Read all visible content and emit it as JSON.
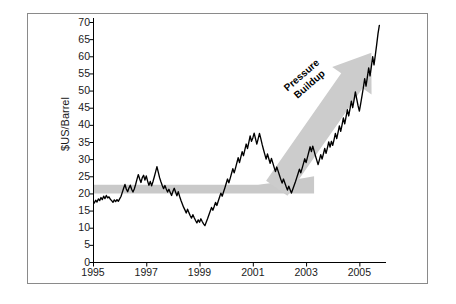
{
  "chart_data": {
    "type": "line",
    "title": "",
    "xlabel": "",
    "ylabel": "$US/Barrel",
    "xlim": [
      1995,
      2006
    ],
    "ylim": [
      0,
      70
    ],
    "grid": false,
    "legend": null,
    "x_ticks": [
      "1995",
      "1997",
      "1999",
      "2001",
      "2003",
      "2005"
    ],
    "x_tick_values": [
      1995,
      1997,
      1999,
      2001,
      2003,
      2005
    ],
    "y_ticks": [
      "0",
      "5",
      "10",
      "15",
      "20",
      "25",
      "30",
      "35",
      "40",
      "45",
      "50",
      "55",
      "60",
      "65",
      "70"
    ],
    "y_tick_values": [
      0,
      5,
      10,
      15,
      20,
      25,
      30,
      35,
      40,
      45,
      50,
      55,
      60,
      65,
      70
    ],
    "series": [
      {
        "name": "Crude oil price",
        "color": "#000000",
        "x": [
          1995.0,
          1995.05,
          1995.1,
          1995.15,
          1995.2,
          1995.25,
          1995.3,
          1995.35,
          1995.4,
          1995.45,
          1995.5,
          1995.55,
          1995.6,
          1995.65,
          1995.7,
          1995.75,
          1995.8,
          1995.85,
          1995.9,
          1995.95,
          1996.0,
          1996.05,
          1996.1,
          1996.15,
          1996.2,
          1996.25,
          1996.3,
          1996.35,
          1996.4,
          1996.45,
          1996.5,
          1996.55,
          1996.6,
          1996.65,
          1996.7,
          1996.75,
          1996.8,
          1996.85,
          1996.9,
          1996.95,
          1997.0,
          1997.05,
          1997.1,
          1997.15,
          1997.2,
          1997.25,
          1997.3,
          1997.35,
          1997.4,
          1997.45,
          1997.5,
          1997.55,
          1997.6,
          1997.65,
          1997.7,
          1997.75,
          1997.8,
          1997.85,
          1997.9,
          1997.95,
          1998.0,
          1998.05,
          1998.1,
          1998.15,
          1998.2,
          1998.25,
          1998.3,
          1998.35,
          1998.4,
          1998.45,
          1998.5,
          1998.55,
          1998.6,
          1998.65,
          1998.7,
          1998.75,
          1998.8,
          1998.85,
          1998.9,
          1998.95,
          1999.0,
          1999.05,
          1999.1,
          1999.15,
          1999.2,
          1999.25,
          1999.3,
          1999.35,
          1999.4,
          1999.45,
          1999.5,
          1999.55,
          1999.6,
          1999.65,
          1999.7,
          1999.75,
          1999.8,
          1999.85,
          1999.9,
          1999.95,
          2000.0,
          2000.05,
          2000.1,
          2000.15,
          2000.2,
          2000.25,
          2000.3,
          2000.35,
          2000.4,
          2000.45,
          2000.5,
          2000.55,
          2000.6,
          2000.65,
          2000.7,
          2000.75,
          2000.8,
          2000.85,
          2000.9,
          2000.95,
          2001.0,
          2001.05,
          2001.1,
          2001.15,
          2001.2,
          2001.25,
          2001.3,
          2001.35,
          2001.4,
          2001.45,
          2001.5,
          2001.55,
          2001.6,
          2001.65,
          2001.7,
          2001.75,
          2001.8,
          2001.85,
          2001.9,
          2001.95,
          2002.0,
          2002.05,
          2002.1,
          2002.15,
          2002.2,
          2002.25,
          2002.3,
          2002.35,
          2002.4,
          2002.45,
          2002.5,
          2002.55,
          2002.6,
          2002.65,
          2002.7,
          2002.75,
          2002.8,
          2002.85,
          2002.9,
          2002.95,
          2003.0,
          2003.05,
          2003.1,
          2003.15,
          2003.2,
          2003.25,
          2003.3,
          2003.35,
          2003.4,
          2003.45,
          2003.5,
          2003.55,
          2003.6,
          2003.65,
          2003.7,
          2003.75,
          2003.8,
          2003.85,
          2003.9,
          2003.95,
          2004.0,
          2004.05,
          2004.1,
          2004.15,
          2004.2,
          2004.25,
          2004.3,
          2004.35,
          2004.4,
          2004.45,
          2004.5,
          2004.55,
          2004.6,
          2004.65,
          2004.7,
          2004.75,
          2004.8,
          2004.85,
          2004.9,
          2004.95,
          2005.0,
          2005.05,
          2005.1,
          2005.15,
          2005.2,
          2005.25,
          2005.3,
          2005.35,
          2005.4,
          2005.45,
          2005.5,
          2005.55,
          2005.6,
          2005.65,
          2005.7,
          2005.75
        ],
        "y": [
          17.8,
          17.2,
          18.0,
          17.5,
          18.4,
          17.9,
          18.8,
          18.2,
          19.2,
          18.5,
          19.4,
          18.7,
          19.0,
          18.3,
          17.9,
          17.4,
          18.1,
          17.6,
          18.2,
          17.7,
          18.4,
          19.1,
          20.3,
          21.5,
          22.6,
          21.3,
          20.5,
          21.6,
          22.4,
          21.2,
          20.4,
          21.3,
          22.6,
          24.1,
          25.5,
          24.3,
          23.2,
          24.6,
          25.3,
          23.9,
          25.1,
          23.6,
          22.4,
          23.5,
          22.2,
          23.4,
          24.8,
          26.3,
          27.8,
          26.2,
          24.6,
          23.4,
          22.3,
          21.4,
          22.3,
          21.3,
          20.4,
          21.2,
          20.3,
          19.4,
          20.6,
          21.5,
          20.4,
          19.3,
          20.5,
          19.2,
          18.0,
          17.0,
          16.0,
          15.2,
          14.3,
          15.4,
          14.4,
          13.5,
          12.8,
          13.8,
          12.9,
          12.1,
          11.4,
          12.3,
          11.6,
          12.6,
          11.8,
          11.1,
          10.6,
          11.6,
          12.6,
          13.7,
          14.8,
          15.9,
          15.1,
          16.2,
          17.4,
          16.5,
          17.7,
          18.9,
          20.1,
          19.2,
          20.4,
          21.6,
          22.9,
          24.2,
          23.1,
          24.4,
          25.8,
          27.2,
          26.0,
          27.4,
          28.9,
          30.4,
          29.0,
          30.6,
          32.2,
          31.0,
          32.7,
          34.4,
          33.1,
          34.9,
          36.8,
          35.2,
          36.2,
          37.6,
          36.0,
          34.4,
          35.9,
          37.5,
          36.0,
          34.3,
          32.8,
          31.4,
          30.0,
          31.5,
          30.1,
          28.8,
          30.2,
          28.9,
          27.6,
          26.4,
          27.7,
          26.5,
          25.3,
          24.1,
          23.0,
          24.2,
          23.1,
          22.0,
          21.0,
          22.1,
          21.1,
          20.1,
          21.2,
          22.3,
          23.4,
          24.6,
          25.8,
          27.1,
          26.0,
          27.3,
          28.7,
          30.1,
          29.0,
          30.5,
          32.0,
          33.6,
          32.2,
          33.8,
          32.4,
          31.0,
          29.7,
          28.4,
          29.8,
          31.3,
          30.0,
          31.5,
          33.1,
          31.7,
          33.3,
          35.0,
          33.5,
          35.2,
          34.0,
          35.7,
          37.5,
          36.0,
          37.8,
          39.7,
          38.1,
          40.0,
          42.0,
          40.3,
          42.3,
          44.4,
          42.6,
          44.7,
          46.9,
          45.0,
          47.2,
          49.6,
          47.6,
          45.6,
          44.0,
          46.2,
          48.5,
          50.9,
          53.5,
          51.3,
          53.9,
          56.6,
          54.3,
          57.0,
          59.9,
          57.5,
          60.4,
          63.4,
          66.6,
          69.0
        ]
      }
    ],
    "annotations": [
      {
        "name": "pressure-buildup",
        "line1": "Pressure",
        "line2": "Buildup",
        "color": "#000000",
        "rotation_deg": -41
      }
    ],
    "shapes": [
      {
        "name": "baseline-band",
        "description": "horizontal grey band at about 20-22 $US/Barrel spanning 1995-2003",
        "color": "#c9c9c9",
        "value_low": 20.0,
        "value_high": 22.5
      },
      {
        "name": "pressure-arrow",
        "description": "thick grey arrow rising from about 2002 at 22 $US/Barrel to 2005.7 at 66 $US/Barrel",
        "color": "#cccccc"
      }
    ]
  },
  "figure": {
    "border_color": "#8a8a8a",
    "background": "#ffffff",
    "axis_color": "#000000"
  }
}
